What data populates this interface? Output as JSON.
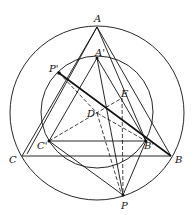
{
  "diagram": {
    "type": "geometry",
    "labels": {
      "A": "A",
      "A_prime": "A'",
      "B": "B",
      "B_prime": "B'",
      "C": "C",
      "C_prime": "C'",
      "P": "P",
      "P_prime": "P'",
      "D": "D",
      "E": "E"
    },
    "points": {
      "A": [
        97,
        27
      ],
      "B": [
        171,
        156
      ],
      "C": [
        22,
        156
      ],
      "A_prime": [
        97,
        58
      ],
      "B_prime": [
        146,
        141
      ],
      "C_prime": [
        49,
        141
      ],
      "P": [
        123,
        195
      ],
      "P_prime": [
        59,
        73
      ],
      "D": [
        97,
        113
      ],
      "E": [
        122,
        98
      ]
    },
    "circles": [
      {
        "name": "outer-circle",
        "center": [
          97,
          113
        ],
        "radius": 87
      },
      {
        "name": "inner-circle",
        "center": [
          97,
          113
        ],
        "radius": 56
      }
    ],
    "stroke_color": "#111111"
  }
}
